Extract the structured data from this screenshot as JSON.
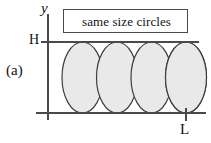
{
  "figure": {
    "panel_label": "(a)",
    "callout_label": "same size circles",
    "axes": {
      "y_axis_label": "y",
      "top_level_label": "H",
      "right_tick_label": "L"
    },
    "colors": {
      "circle_fill": "#e9e9e9",
      "circle_stroke": "#3d3d3d",
      "axis_stroke": "#4a4a4a",
      "text": "#111111",
      "background": "#ffffff"
    }
  },
  "chart_data": {
    "type": "scatter",
    "title": "",
    "subtitle": "",
    "xlabel": "",
    "ylabel": "y",
    "annotations": [
      "same size circles",
      "(a)",
      "H",
      "L"
    ],
    "grid": false,
    "legend": null,
    "xlim": [
      0,
      211
    ],
    "ylim": [
      0,
      143
    ],
    "geometry": {
      "y_axis_x": 48,
      "y_axis_top": 14,
      "y_axis_bottom": 120,
      "x_axis_y": 113,
      "x_axis_left": 36,
      "x_axis_right": 206,
      "top_line_y": 42,
      "top_line_left": 41,
      "top_line_right": 199,
      "l_tick_x": 186,
      "l_tick_top": 108,
      "l_tick_bottom": 121
    },
    "circles": {
      "count": 5,
      "equal_size": true,
      "rx": 20.5,
      "ry": 35.5,
      "cy": 77.5,
      "cx": [
        48,
        82.5,
        117,
        151.5,
        186
      ]
    }
  }
}
